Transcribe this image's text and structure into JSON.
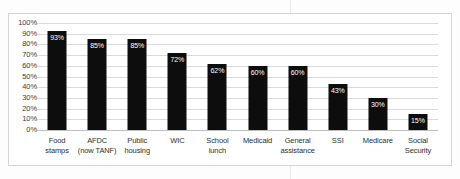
{
  "chart_data": {
    "type": "bar",
    "title": "",
    "xlabel": "",
    "ylabel": "",
    "ylim": [
      0,
      100
    ],
    "ytick_labels": [
      "100%",
      "90%",
      "80%",
      "70%",
      "60%",
      "50%",
      "40%",
      "30%",
      "20%",
      "10%",
      "0%"
    ],
    "ytick_values": [
      100,
      90,
      80,
      70,
      60,
      50,
      40,
      30,
      20,
      10,
      0
    ],
    "grid": true,
    "legend": "none",
    "categories": [
      "Food stamps",
      "AFDC (now TANF)",
      "Public housing",
      "WIC",
      "School lunch",
      "Medicaid",
      "General assistance",
      "SSI",
      "Medicare",
      "Social Security"
    ],
    "category_lines": [
      [
        "Food",
        "stamps"
      ],
      [
        "AFDC",
        "(now TANF)"
      ],
      [
        "Public",
        "housing"
      ],
      [
        "WIC",
        ""
      ],
      [
        "School",
        "lunch"
      ],
      [
        "Medicaid",
        ""
      ],
      [
        "General",
        "assistance"
      ],
      [
        "SSI",
        ""
      ],
      [
        "Medicare",
        ""
      ],
      [
        "Social",
        "Security"
      ]
    ],
    "values": [
      93,
      85,
      85,
      72,
      62,
      60,
      60,
      43,
      30,
      15
    ],
    "value_labels": [
      "93%",
      "85%",
      "85%",
      "72%",
      "62%",
      "60%",
      "60%",
      "43%",
      "30%",
      "15%"
    ],
    "colors": {
      "bar": "#0d0d0d",
      "value_label": "#ffffff",
      "gridline": "#d9d9d9",
      "axis_text": "#3a3a3a",
      "frame": "#d5d5d5",
      "background": "#ffffff"
    }
  }
}
